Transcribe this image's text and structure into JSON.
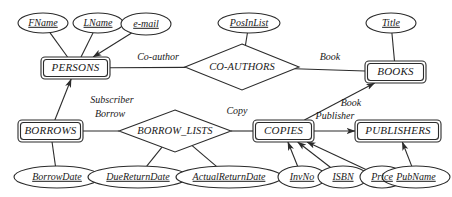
{
  "diagram": {
    "type": "entity-relationship-diagram",
    "colors": {
      "stroke": "#2b2b2b",
      "fill": "#ffffff",
      "background": "#ffffff"
    },
    "entities": [
      {
        "id": "persons",
        "label": "PERSONS",
        "x": 41,
        "y": 57,
        "w": 69,
        "h": 22
      },
      {
        "id": "books",
        "label": "BOOKS",
        "x": 365,
        "y": 61,
        "w": 61,
        "h": 22
      },
      {
        "id": "borrows",
        "label": "BORROWS",
        "x": 18,
        "y": 120,
        "w": 65,
        "h": 22
      },
      {
        "id": "copies",
        "label": "COPIES",
        "x": 253,
        "y": 120,
        "w": 61,
        "h": 22
      },
      {
        "id": "publishers",
        "label": "PUBLISHERS",
        "x": 355,
        "y": 120,
        "w": 86,
        "h": 22
      }
    ],
    "relationships": [
      {
        "id": "co-authors",
        "label": "CO-AUTHORS",
        "cx": 242,
        "cy": 67,
        "rx": 57,
        "ry": 23
      },
      {
        "id": "borrow-lists",
        "label": "BORROW_LISTS",
        "cx": 175,
        "cy": 131,
        "rx": 56,
        "ry": 21
      }
    ],
    "attributes": [
      {
        "id": "fname",
        "label": "FName",
        "cx": 43,
        "cy": 23,
        "rx": 25,
        "ry": 10
      },
      {
        "id": "lname",
        "label": "LName",
        "cx": 98,
        "cy": 23,
        "rx": 25,
        "ry": 10
      },
      {
        "id": "email",
        "label": "e-mail",
        "cx": 146,
        "cy": 24,
        "rx": 25,
        "ry": 11
      },
      {
        "id": "posinlist",
        "label": "PosInList",
        "cx": 249,
        "cy": 23,
        "rx": 31,
        "ry": 10
      },
      {
        "id": "title",
        "label": "Title",
        "cx": 391,
        "cy": 23,
        "rx": 25,
        "ry": 10
      },
      {
        "id": "borrowdate",
        "label": "BorrowDate",
        "cx": 57,
        "cy": 177,
        "rx": 43,
        "ry": 11
      },
      {
        "id": "duereturndate",
        "label": "DueReturnDate",
        "cx": 138,
        "cy": 177,
        "rx": 50,
        "ry": 11
      },
      {
        "id": "actualreturndate",
        "label": "ActualReturnDate",
        "cx": 229,
        "cy": 177,
        "rx": 53,
        "ry": 11
      },
      {
        "id": "invno",
        "label": "InvNo",
        "cx": 302,
        "cy": 177,
        "rx": 24,
        "ry": 11
      },
      {
        "id": "isbn",
        "label": "ISBN",
        "cx": 343,
        "cy": 177,
        "rx": 25,
        "ry": 11
      },
      {
        "id": "price",
        "label": "Price",
        "cx": 382,
        "cy": 177,
        "rx": 22,
        "ry": 11
      },
      {
        "id": "pubname",
        "label": "PubName",
        "cx": 416,
        "cy": 177,
        "rx": 34,
        "ry": 11
      }
    ],
    "edge_labels": [
      {
        "id": "co-author-label",
        "label": "Co-author",
        "x": 158,
        "y": 58
      },
      {
        "id": "book-label-1",
        "label": "Book",
        "x": 330,
        "y": 58
      },
      {
        "id": "subscriber",
        "label": "Subscriber",
        "x": 112,
        "y": 101
      },
      {
        "id": "borrow",
        "label": "Borrow",
        "x": 110,
        "y": 115
      },
      {
        "id": "copy",
        "label": "Copy",
        "x": 237,
        "y": 112
      },
      {
        "id": "book-label-2",
        "label": "Book",
        "x": 351,
        "y": 104
      },
      {
        "id": "publisher",
        "label": "Publisher",
        "x": 335,
        "y": 117
      }
    ],
    "connections": [
      {
        "id": "fname-persons",
        "from": "fname",
        "to": "persons"
      },
      {
        "id": "lname-persons",
        "from": "lname",
        "to": "persons"
      },
      {
        "id": "email-persons",
        "from": "email",
        "to": "persons",
        "arrow": true
      },
      {
        "id": "persons-coauthors",
        "from": "persons",
        "to": "co-authors"
      },
      {
        "id": "posinlist-coauthors",
        "from": "posinlist",
        "to": "co-authors"
      },
      {
        "id": "coauthors-books",
        "from": "co-authors",
        "to": "books"
      },
      {
        "id": "title-books",
        "from": "title",
        "to": "books"
      },
      {
        "id": "persons-borrows",
        "from": "borrows",
        "to": "persons",
        "arrow": true
      },
      {
        "id": "borrows-borrowlists",
        "from": "borrows",
        "to": "borrow-lists"
      },
      {
        "id": "borrows-borrowdate",
        "from": "borrows",
        "to": "borrowdate"
      },
      {
        "id": "borrowlists-duedate",
        "from": "borrow-lists",
        "to": "duereturndate"
      },
      {
        "id": "borrowlists-actualdate",
        "from": "borrow-lists",
        "to": "actualreturndate"
      },
      {
        "id": "borrowlists-copies",
        "from": "borrow-lists",
        "to": "copies"
      },
      {
        "id": "copies-books",
        "from": "copies",
        "to": "books",
        "arrow": true
      },
      {
        "id": "copies-publishers",
        "from": "copies",
        "to": "publishers",
        "arrow": true
      },
      {
        "id": "invno-copies",
        "from": "invno",
        "to": "copies",
        "arrow": true
      },
      {
        "id": "isbn-copies",
        "from": "isbn",
        "to": "copies",
        "arrow": true
      },
      {
        "id": "price-copies",
        "from": "price",
        "to": "copies",
        "arrow": true
      },
      {
        "id": "pubname-publishers",
        "from": "pubname",
        "to": "publishers",
        "arrow": true
      }
    ]
  }
}
